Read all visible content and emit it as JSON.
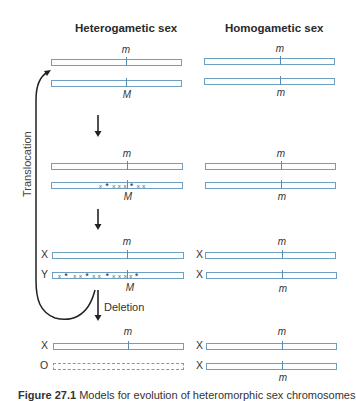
{
  "columns": {
    "heterogametic": "Heterogametic sex",
    "homogametic": "Homogametic sex"
  },
  "stages": [
    {
      "heterogametic": [
        {
          "allele": "m",
          "allele_pos": "above",
          "label": "",
          "marks": ""
        },
        {
          "allele": "M",
          "allele_pos": "below",
          "label": "",
          "marks": ""
        }
      ],
      "homogametic": [
        {
          "allele": "m",
          "allele_pos": "above",
          "label": ""
        },
        {
          "allele": "m",
          "allele_pos": "below",
          "label": ""
        }
      ]
    },
    {
      "heterogametic": [
        {
          "allele": "m",
          "allele_pos": "above",
          "label": "",
          "marks": ""
        },
        {
          "allele": "M",
          "allele_pos": "below",
          "label": "",
          "marks": "x • x x | • x x"
        }
      ],
      "homogametic": [
        {
          "allele": "m",
          "allele_pos": "above",
          "label": ""
        },
        {
          "allele": "m",
          "allele_pos": "below",
          "label": ""
        }
      ]
    },
    {
      "heterogametic": [
        {
          "allele": "m",
          "allele_pos": "above",
          "label": "X",
          "marks": ""
        },
        {
          "allele": "M",
          "allele_pos": "below",
          "label": "Y",
          "marks": "x • x x • x x | • x x x x •"
        }
      ],
      "homogametic": [
        {
          "allele": "m",
          "allele_pos": "above",
          "label": "X"
        },
        {
          "allele": "m",
          "allele_pos": "below",
          "label": "X"
        }
      ]
    },
    {
      "heterogametic": [
        {
          "allele": "m",
          "allele_pos": "above",
          "label": "X",
          "marks": ""
        },
        {
          "allele": "",
          "allele_pos": "none",
          "label": "O",
          "marks": "",
          "style": "dashed"
        }
      ],
      "homogametic": [
        {
          "allele": "m",
          "allele_pos": "above",
          "label": "X"
        },
        {
          "allele": "m",
          "allele_pos": "below",
          "label": "X"
        }
      ]
    }
  ],
  "arrows": {
    "translocation_label": "Translocation",
    "deletion_label": "Deletion"
  },
  "caption": {
    "figure": "Figure 27.1",
    "text": "Models for evolution of heteromorphic sex chromosomes"
  },
  "colors": {
    "chromosome_outline": "#6e9fc0",
    "arrow": "#222222"
  }
}
